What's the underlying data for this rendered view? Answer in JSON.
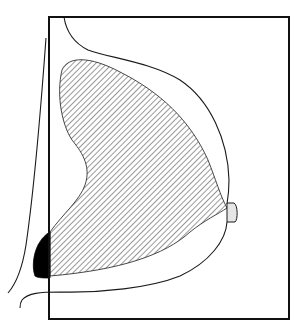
{
  "diagram": {
    "type": "anatomical-line-drawing",
    "colors": {
      "background": "#ffffff",
      "stroke": "#1a1a1a",
      "hatch": "#444444",
      "solid_fill": "#000000",
      "nipple_fill": "#e6e6e6"
    },
    "elements": [
      {
        "id": "frame",
        "shape": "rectangle"
      },
      {
        "id": "skin-outline",
        "shape": "curve"
      },
      {
        "id": "chest-wall-line",
        "shape": "curve"
      },
      {
        "id": "glandular-tissue",
        "shape": "hatched-region"
      },
      {
        "id": "pectoral-region",
        "shape": "solid-region"
      },
      {
        "id": "nipple",
        "shape": "rounded-rect"
      },
      {
        "id": "inframammary-fold",
        "shape": "curve"
      }
    ]
  }
}
